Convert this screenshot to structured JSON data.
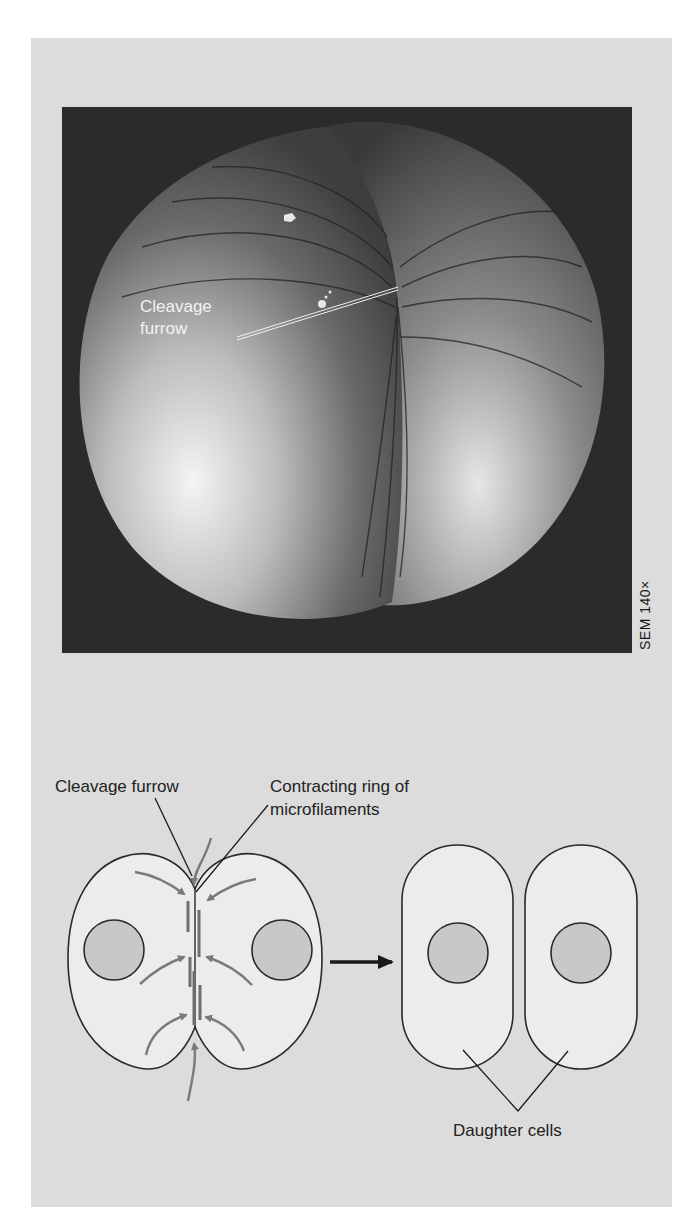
{
  "figure": {
    "micrograph": {
      "description": "SEM of a dividing animal cell (zygote) showing cleavage furrow",
      "labels": {
        "cleavage_furrow_line1": "Cleavage",
        "cleavage_furrow_line2": "furrow"
      },
      "scale_note": "SEM 140×"
    },
    "diagram": {
      "labels": {
        "cleavage_furrow": "Cleavage furrow",
        "contracting_ring_line1": "Contracting ring of",
        "contracting_ring_line2": "microfilaments",
        "daughter_cells": "Daughter cells"
      }
    },
    "colors": {
      "panel_bg": "#dcdcdc",
      "cell_fill": "#ececec",
      "nucleus_fill": "#c8c8c8",
      "outline": "#2a2a2a",
      "force_arrows": "#7a7a7a",
      "microfilaments": "#6e6e6e",
      "sem_bg": "#2b2b2b"
    }
  }
}
